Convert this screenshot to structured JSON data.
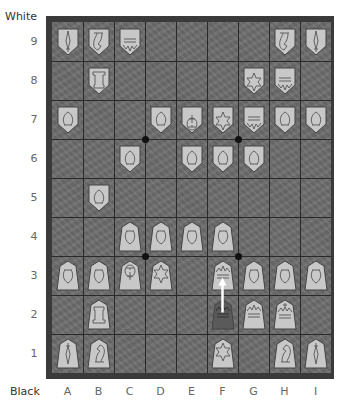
{
  "labels": {
    "top_player": "White",
    "bottom_player": "Black",
    "files": [
      "A",
      "B",
      "C",
      "D",
      "E",
      "F",
      "G",
      "H",
      "I"
    ],
    "ranks": [
      "9",
      "8",
      "7",
      "6",
      "5",
      "4",
      "3",
      "2",
      "1"
    ]
  },
  "colors": {
    "frame": "#3a3a3a",
    "board": "#6e6e6e",
    "grid": "#2a2a2a",
    "piece_fill": "#c8c8c8",
    "piece_outline": "#444444",
    "move_origin_fill": "#5a5a5a",
    "arrow": "#ffffff"
  },
  "pieces": [
    {
      "side": "white",
      "type": "lance",
      "square": "A9"
    },
    {
      "side": "white",
      "type": "knight",
      "square": "B9"
    },
    {
      "side": "white",
      "type": "gold",
      "square": "C9"
    },
    {
      "side": "white",
      "type": "knight",
      "square": "H9"
    },
    {
      "side": "white",
      "type": "lance",
      "square": "I9"
    },
    {
      "side": "white",
      "type": "rook",
      "square": "B8"
    },
    {
      "side": "white",
      "type": "silver",
      "square": "G8"
    },
    {
      "side": "white",
      "type": "gold",
      "square": "H8"
    },
    {
      "side": "white",
      "type": "pawn",
      "square": "A7"
    },
    {
      "side": "white",
      "type": "pawn",
      "square": "D7"
    },
    {
      "side": "white",
      "type": "king",
      "square": "E7"
    },
    {
      "side": "white",
      "type": "silver",
      "square": "F7"
    },
    {
      "side": "white",
      "type": "gold",
      "square": "G7"
    },
    {
      "side": "white",
      "type": "pawn",
      "square": "H7"
    },
    {
      "side": "white",
      "type": "pawn",
      "square": "I7"
    },
    {
      "side": "white",
      "type": "pawn",
      "square": "C6"
    },
    {
      "side": "white",
      "type": "pawn",
      "square": "E6"
    },
    {
      "side": "white",
      "type": "pawn",
      "square": "F6"
    },
    {
      "side": "white",
      "type": "pawn",
      "square": "G6"
    },
    {
      "side": "white",
      "type": "pawn",
      "square": "B5"
    },
    {
      "side": "black",
      "type": "pawn",
      "square": "C4"
    },
    {
      "side": "black",
      "type": "pawn",
      "square": "D4"
    },
    {
      "side": "black",
      "type": "pawn",
      "square": "E4"
    },
    {
      "side": "black",
      "type": "pawn",
      "square": "F4"
    },
    {
      "side": "black",
      "type": "pawn",
      "square": "A3"
    },
    {
      "side": "black",
      "type": "pawn",
      "square": "B3"
    },
    {
      "side": "black",
      "type": "king",
      "square": "C3"
    },
    {
      "side": "black",
      "type": "silver",
      "square": "D3"
    },
    {
      "side": "black",
      "type": "gold",
      "square": "F3",
      "highlight": "destination"
    },
    {
      "side": "black",
      "type": "pawn",
      "square": "G3"
    },
    {
      "side": "black",
      "type": "pawn",
      "square": "H3"
    },
    {
      "side": "black",
      "type": "pawn",
      "square": "I3"
    },
    {
      "side": "black",
      "type": "rook",
      "square": "B2"
    },
    {
      "side": "black",
      "type": "gold",
      "square": "F2",
      "highlight": "origin"
    },
    {
      "side": "black",
      "type": "gold",
      "square": "G2"
    },
    {
      "side": "black",
      "type": "gold-king",
      "square": "H2"
    },
    {
      "side": "black",
      "type": "lance",
      "square": "A1"
    },
    {
      "side": "black",
      "type": "knight",
      "square": "B1"
    },
    {
      "side": "black",
      "type": "silver",
      "square": "F1"
    },
    {
      "side": "black",
      "type": "knight",
      "square": "H1"
    },
    {
      "side": "black",
      "type": "lance",
      "square": "I1"
    }
  ],
  "last_move": {
    "from": "F2",
    "to": "F3"
  },
  "hoshi_points": [
    "C6/D7",
    "F6/G7",
    "C3/D4",
    "F3/G4"
  ]
}
